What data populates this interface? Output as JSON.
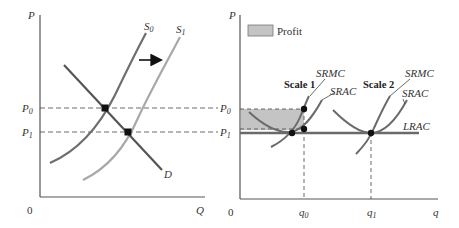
{
  "left_panel": {
    "axis": {
      "y_label": "P",
      "x_label": "Q",
      "origin": "0"
    },
    "price_levels": [
      {
        "name": "P",
        "sub": "0"
      },
      {
        "name": "P",
        "sub": "1"
      }
    ],
    "curves": {
      "supply_0": {
        "name": "S",
        "sub": "0"
      },
      "supply_1": {
        "name": "S",
        "sub": "1"
      },
      "demand": {
        "name": "D"
      }
    },
    "shift_arrow": "right"
  },
  "right_panel": {
    "axis": {
      "y_label": "P",
      "x_label": "q",
      "origin": "0"
    },
    "legend": {
      "label": "Profit",
      "color": "#c4c4c4"
    },
    "price_levels": [
      {
        "name": "P",
        "sub": "0"
      },
      {
        "name": "P",
        "sub": "1"
      }
    ],
    "quantities": [
      {
        "name": "q",
        "sub": "0"
      },
      {
        "name": "q",
        "sub": "1"
      }
    ],
    "scales": [
      {
        "title": "Scale 1",
        "mc_label": "SRMC",
        "ac_label": "SRAC"
      },
      {
        "title": "Scale 2",
        "mc_label": "SRMC",
        "ac_label": "SRAC"
      }
    ],
    "lrac_label": "LRAC"
  },
  "colors": {
    "axis": "#555555",
    "supply_0": "#6e6e6e",
    "supply_1": "#a8a8a8",
    "demand": "#555555",
    "cost_curves": "#6a6a6a",
    "lrac": "#6a6a6a",
    "profit_fill": "#c4c4c4",
    "dot": "#111111"
  }
}
